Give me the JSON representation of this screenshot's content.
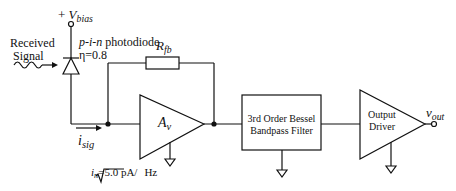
{
  "labels": {
    "vbias_plus": "+",
    "vbias": "V",
    "vbias_sub": "bias",
    "received_signal_line1": "Received",
    "received_signal_line2": "Signal",
    "photodiode_type": "p-i-n",
    "photodiode_word": "photodiode",
    "efficiency": "η=0.8",
    "rfb": "R",
    "rfb_sub": "fb",
    "amp": "A",
    "amp_sub": "v",
    "isig": "i",
    "isig_sub": "sig",
    "noise": "i",
    "noise_sub": "n",
    "noise_value": "=5.0 pA/",
    "noise_unit": "Hz",
    "filter_line1": "3rd Order Bessel",
    "filter_line2": "Bandpass Filter",
    "driver_line1": "Output",
    "driver_line2": "Driver",
    "vout": "v",
    "vout_sub": "out"
  },
  "colors": {
    "line": "#111111",
    "background": "#ffffff"
  }
}
